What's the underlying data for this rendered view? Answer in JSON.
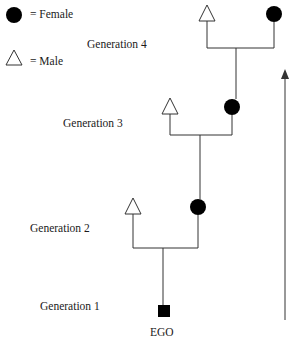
{
  "legend": {
    "female_label": "= Female",
    "male_label": "= Male"
  },
  "generations": [
    {
      "label": "Generation 4",
      "male": "triangle",
      "female": "circle"
    },
    {
      "label": "Generation 3",
      "male": "triangle",
      "female": "circle"
    },
    {
      "label": "Generation 2",
      "male": "triangle",
      "female": "circle"
    },
    {
      "label": "Generation 1",
      "ego": "square"
    }
  ],
  "ego_label": "EGO",
  "arrow": {
    "direction": "up"
  },
  "colors": {
    "line": "#333333",
    "fill": "#000000",
    "background": "#ffffff"
  }
}
